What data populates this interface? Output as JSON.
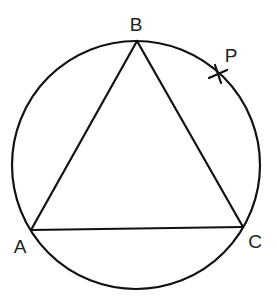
{
  "diagram": {
    "type": "circle-inscribed-triangle",
    "stroke_color": "#111111",
    "background_color": "#ffffff",
    "circle": {
      "cx": 136,
      "cy": 165,
      "r": 124
    },
    "points": {
      "A": {
        "label": "A",
        "x": 31,
        "y": 230,
        "label_x": 20,
        "label_y": 248
      },
      "B": {
        "label": "B",
        "x": 137,
        "y": 41,
        "label_x": 136,
        "label_y": 26
      },
      "C": {
        "label": "C",
        "x": 243,
        "y": 227,
        "label_x": 255,
        "label_y": 243
      },
      "P": {
        "label": "P",
        "x": 218,
        "y": 74,
        "label_x": 231,
        "label_y": 57,
        "marker": "cross"
      }
    },
    "segments": [
      {
        "from": "A",
        "to": "B"
      },
      {
        "from": "B",
        "to": "C"
      },
      {
        "from": "A",
        "to": "C"
      }
    ]
  }
}
